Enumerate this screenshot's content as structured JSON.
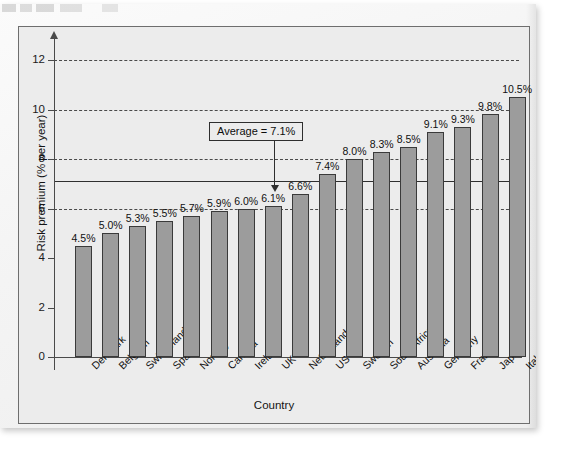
{
  "chart_data": {
    "type": "bar",
    "title": "",
    "xlabel": "Country",
    "ylabel": "Risk premium (% per year)",
    "ylim": [
      0,
      13
    ],
    "yticks": [
      0,
      2,
      4,
      6,
      8,
      10,
      12
    ],
    "ytick_labels": [
      "0",
      "2",
      "4",
      "6",
      "8",
      "10",
      "12"
    ],
    "grid": "horizontal-dashed",
    "gridlines": [
      6,
      8,
      10,
      12
    ],
    "legend": "none",
    "bar_color": "#9c9c9c",
    "bar_edge_color": "#3a3a3a",
    "plot_background": "#ececec",
    "categories": [
      "Denmark",
      "Belgium",
      "Switzerland",
      "Spain",
      "Norway",
      "Canada",
      "Ireland",
      "UK",
      "Netherlands",
      "US",
      "Sweden",
      "South Africa",
      "Australia",
      "Germany",
      "France",
      "Japan",
      "Italy"
    ],
    "values": [
      4.5,
      5.0,
      5.3,
      5.5,
      5.7,
      5.9,
      6.0,
      6.1,
      6.6,
      7.4,
      8.0,
      8.3,
      8.5,
      9.1,
      9.3,
      9.8,
      10.5
    ],
    "value_labels": [
      "4.5%",
      "5.0%",
      "5.3%",
      "5.5%",
      "5.7%",
      "5.9%",
      "6.0%",
      "6.1%",
      "6.6%",
      "7.4%",
      "8.0%",
      "8.3%",
      "8.5%",
      "9.1%",
      "9.3%",
      "9.8%",
      "10.5%"
    ],
    "annotations": [
      {
        "name": "average-line",
        "type": "hline",
        "value": 7.1,
        "label": "Average = 7.1%",
        "line_style": "solid"
      }
    ]
  },
  "axes": {
    "y_title": "Risk premium (% per year)",
    "x_title": "Country"
  },
  "annotation": {
    "average_label": "Average = 7.1%"
  }
}
